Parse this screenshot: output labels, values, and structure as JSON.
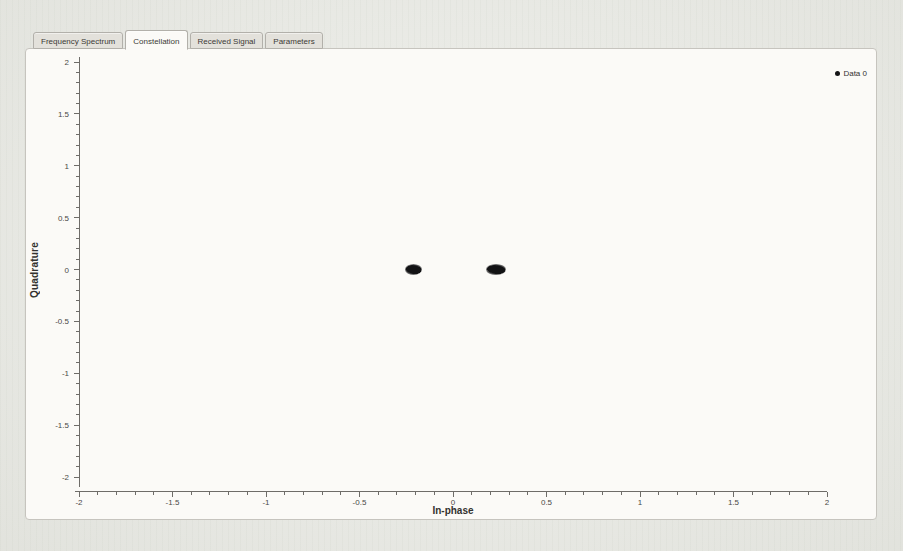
{
  "tabs": {
    "items": [
      {
        "label": "Frequency Spectrum"
      },
      {
        "label": "Constellation"
      },
      {
        "label": "Received Signal"
      },
      {
        "label": "Parameters"
      }
    ],
    "active_index": 1
  },
  "legend": {
    "entries": [
      {
        "marker": "dot",
        "color": "#141416",
        "label": "Data 0"
      }
    ]
  },
  "chart_data": {
    "type": "scatter",
    "title": "",
    "xlabel": "In-phase",
    "ylabel": "Quadrature",
    "xlim": [
      -2,
      2
    ],
    "ylim": [
      -2,
      2
    ],
    "xticks": [
      -2,
      -1.5,
      -1,
      -0.5,
      0,
      0.5,
      1,
      1.5,
      2
    ],
    "yticks": [
      -2,
      -1.5,
      -1,
      -0.5,
      0,
      0.5,
      1,
      1.5,
      2
    ],
    "minor_tick_step": 0.1,
    "grid": false,
    "legend_position": "top-right",
    "series": [
      {
        "name": "Data 0",
        "color": "#141416",
        "marker": "dot-cluster",
        "clusters": [
          {
            "x": -0.21,
            "y": 0.0,
            "spread_x": 0.045,
            "spread_y": 0.05
          },
          {
            "x": 0.23,
            "y": 0.0,
            "spread_x": 0.052,
            "spread_y": 0.055
          }
        ]
      }
    ]
  },
  "colors": {
    "page_bg": "#e9eae4",
    "panel_bg": "#fbfaf7",
    "panel_border": "#c6c4be",
    "axis": "#6e6c68",
    "tick_label": "#4a4946",
    "axis_label": "#33322f",
    "tab_bg": "#e3e1db",
    "tab_active_bg": "#fbfaf7",
    "tab_border": "#b2b0aa",
    "tab_text": "#3c3a36",
    "series_color": "#141416"
  }
}
